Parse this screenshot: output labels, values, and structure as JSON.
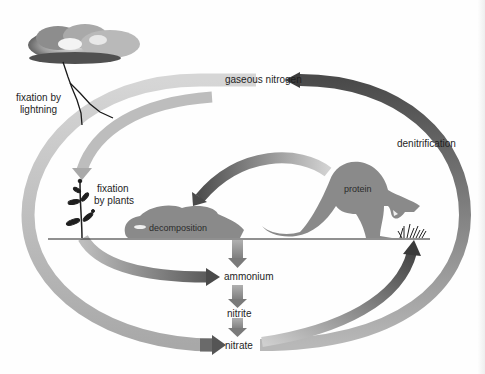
{
  "diagram": {
    "colors": {
      "arrow_light": "#c4c4c4",
      "arrow_mid": "#9a9a9a",
      "arrow_dark": "#555555",
      "silhouette": "#8a8a8a",
      "ground": "#222222",
      "text": "#1e1e1e"
    },
    "nodes": {
      "gaseous_nitrogen": "gaseous nitrogen",
      "ammonium": "ammonium",
      "nitrite": "nitrite",
      "nitrate": "nitrate",
      "protein": "protein",
      "decomposition": "decomposition"
    },
    "processes": {
      "fixation_lightning": [
        "fixation by",
        "lightning"
      ],
      "fixation_plants": [
        "fixation",
        "by plants"
      ],
      "denitrification": "denitrification"
    },
    "icons": [
      "storm-cloud-icon",
      "lightning-bolt-icon",
      "plant-icon",
      "dead-animal-icon",
      "kangaroo-icon",
      "grass-icon"
    ],
    "edges": [
      {
        "from": "gaseous nitrogen",
        "to": "nitrate",
        "via": "fixation by lightning"
      },
      {
        "from": "gaseous nitrogen",
        "to": "plant",
        "via": "fixation by plants"
      },
      {
        "from": "plant",
        "to": "ammonium"
      },
      {
        "from": "protein",
        "to": "decomposition"
      },
      {
        "from": "decomposition",
        "to": "ammonium"
      },
      {
        "from": "ammonium",
        "to": "nitrite"
      },
      {
        "from": "nitrite",
        "to": "nitrate"
      },
      {
        "from": "nitrate",
        "to": "grass"
      },
      {
        "from": "nitrate",
        "to": "gaseous nitrogen",
        "via": "denitrification"
      }
    ]
  }
}
